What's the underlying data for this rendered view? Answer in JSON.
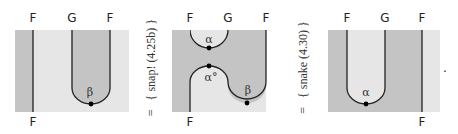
{
  "colors": {
    "light_region": "#e6e6e6",
    "dark_region": "#c4c4c4",
    "line": "#222222",
    "dot": "#000000"
  },
  "diagrams": [
    {
      "top_labels": [
        "F",
        "G",
        "F"
      ],
      "bottom_labels": [
        "F"
      ],
      "node_labels": [
        "β"
      ]
    },
    {
      "top_labels": [
        "F",
        "G",
        "F"
      ],
      "bottom_labels": [
        "F"
      ],
      "node_labels": [
        "α",
        "α°",
        "β"
      ]
    },
    {
      "top_labels": [
        "F",
        "G",
        "F"
      ],
      "bottom_labels": [
        "F"
      ],
      "node_labels": [
        "α"
      ]
    }
  ],
  "equations": [
    {
      "symbol": "=",
      "justification": "{ snap! (4.25b) }"
    },
    {
      "symbol": "=",
      "justification": "{ snake (4.30) }"
    }
  ],
  "terminal": "."
}
